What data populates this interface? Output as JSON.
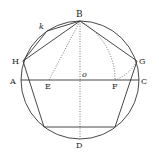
{
  "diagram": {
    "colors": {
      "stroke": "#333333",
      "background": "#ffffff"
    },
    "circle": {
      "cx": 80,
      "cy": 80,
      "r": 59
    },
    "points": {
      "B": {
        "x": 80,
        "y": 21,
        "label": "B"
      },
      "H": {
        "x": 23,
        "y": 61,
        "label": "H"
      },
      "G": {
        "x": 137,
        "y": 61,
        "label": "G"
      },
      "A": {
        "x": 21,
        "y": 80,
        "label": "A"
      },
      "C": {
        "x": 139,
        "y": 80,
        "label": "C"
      },
      "E": {
        "x": 49,
        "y": 80,
        "label": "E"
      },
      "F": {
        "x": 115,
        "y": 80,
        "label": "F"
      },
      "o": {
        "x": 80,
        "y": 80,
        "label": "o"
      },
      "D": {
        "x": 80,
        "y": 139,
        "label": "D"
      },
      "k": {
        "x": 47,
        "y": 31,
        "label": "k"
      },
      "P4": {
        "x": 44,
        "y": 127
      },
      "P5": {
        "x": 115,
        "y": 127
      }
    },
    "labels": {
      "B": "B",
      "H": "H",
      "G": "G",
      "A": "A",
      "C": "C",
      "E": "E",
      "F": "F",
      "o": "o",
      "D": "D",
      "k": "k"
    }
  }
}
